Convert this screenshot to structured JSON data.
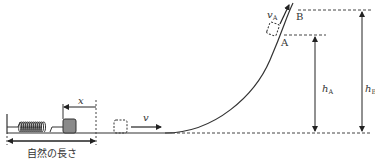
{
  "labels": {
    "x": "x",
    "v": "v",
    "vA_main": "v",
    "vA_sub": "A",
    "A": "A",
    "B": "B",
    "hA_main": "h",
    "hA_sub": "A",
    "hB_main": "h",
    "hB_sub": "B",
    "natural_length": "自然の長さ"
  },
  "colors": {
    "line": "#333333",
    "block": "#888888",
    "dash": "#444444"
  }
}
